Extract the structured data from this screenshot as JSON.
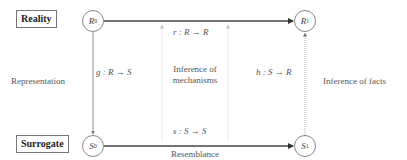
{
  "domains": {
    "top_label": "Reality",
    "bottom_label": "Surrogate"
  },
  "nodes": {
    "r0": {
      "base": "R",
      "sub": "0"
    },
    "r1": {
      "base": "R",
      "sub": "1"
    },
    "s0": {
      "base": "S",
      "sub": "0"
    },
    "s1": {
      "base": "S",
      "sub": "1"
    }
  },
  "maps": {
    "g": "g : R → S",
    "r": "r : R → R",
    "s": "s : S → S",
    "h": "h : S → R"
  },
  "annotations": {
    "representation": "Representation",
    "inference_mechanisms_line1": "Inference of",
    "inference_mechanisms_line2": "mechanisms",
    "inference_facts": "Inference of facts",
    "resemblance": "Resemblance"
  },
  "colors": {
    "line": "#555555",
    "dotted": "#aaaaaa",
    "node_border": "#888888"
  }
}
